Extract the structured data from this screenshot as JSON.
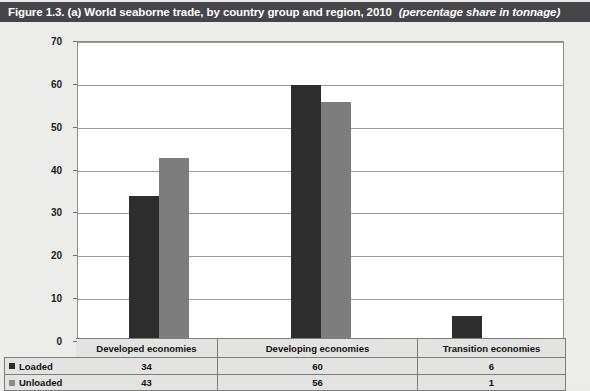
{
  "title": {
    "main": "Figure 1.3.  (a) World seaborne trade, by country group and region, 2010",
    "note": "(percentage share in tonnage)"
  },
  "chart_data": {
    "type": "bar",
    "title": "Figure 1.3.  (a) World seaborne trade, by country group and region, 2010",
    "subtitle": "(percentage share in tonnage)",
    "categories": [
      "Developed economies",
      "Developing economies",
      "Transition economies"
    ],
    "series": [
      {
        "name": "Loaded",
        "values": [
          34,
          60,
          6
        ],
        "color": "#2d2d2d"
      },
      {
        "name": "Unloaded",
        "values": [
          43,
          56,
          1
        ],
        "color": "#7d7d7d"
      }
    ],
    "xlabel": "",
    "ylabel": "",
    "ylim": [
      0,
      70
    ],
    "yticks": [
      0,
      10,
      20,
      30,
      40,
      50,
      60,
      70
    ],
    "grid": true,
    "legend_position": "table-left"
  },
  "table": {
    "header_blank": "",
    "columns": [
      "Developed economies",
      "Developing economies",
      "Transition economies"
    ],
    "rows": [
      {
        "label": "Loaded",
        "swatch": "loaded-swatch",
        "values": [
          "34",
          "60",
          "6"
        ]
      },
      {
        "label": "Unloaded",
        "swatch": "unloaded-swatch",
        "values": [
          "43",
          "56",
          "1"
        ]
      }
    ]
  }
}
